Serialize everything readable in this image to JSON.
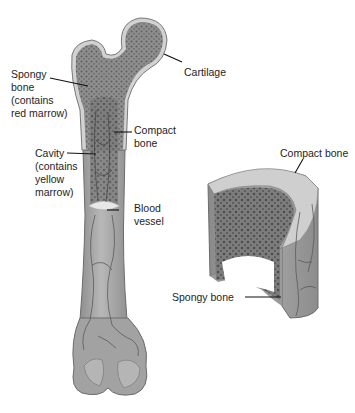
{
  "diagram": {
    "femur_labels": {
      "spongy_bone": "Spongy\nbone\n(contains\nred marrow)",
      "cartilage": "Cartilage",
      "compact_bone": "Compact\nbone",
      "cavity": "Cavity\n(contains\nyellow\nmarrow)",
      "blood_vessel": "Blood\nvessel"
    },
    "cross_section_labels": {
      "compact_bone": "Compact bone",
      "spongy_bone": "Spongy bone"
    },
    "colors": {
      "bone_shaft": "#a9a9a9",
      "bone_shade": "#8c8c8c",
      "spongy": "#7a7a7a",
      "cartilage_rim": "#d4d4d4",
      "vessel": "#5a5a5a",
      "leader_line": "#111111"
    }
  }
}
